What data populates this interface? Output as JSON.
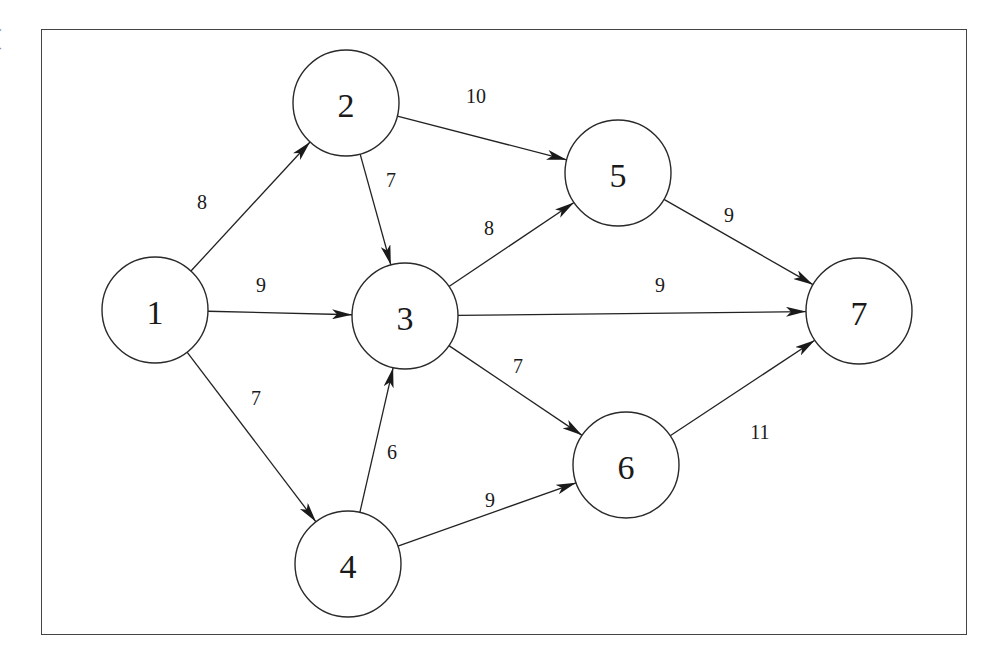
{
  "diagram": {
    "type": "directed-weighted-graph",
    "corner_mark": "(",
    "colors": {
      "stroke": "#222222",
      "background": "#ffffff",
      "frame": "#444444"
    },
    "nodes": [
      {
        "id": "1",
        "label": "1",
        "x": 155,
        "y": 310
      },
      {
        "id": "2",
        "label": "2",
        "x": 346,
        "y": 103
      },
      {
        "id": "3",
        "label": "3",
        "x": 405,
        "y": 316
      },
      {
        "id": "4",
        "label": "4",
        "x": 348,
        "y": 564
      },
      {
        "id": "5",
        "label": "5",
        "x": 618,
        "y": 173
      },
      {
        "id": "6",
        "label": "6",
        "x": 626,
        "y": 465
      },
      {
        "id": "7",
        "label": "7",
        "x": 859,
        "y": 311
      }
    ],
    "node_radius": 53,
    "edges": [
      {
        "from": "1",
        "to": "2",
        "weight": "8",
        "lx": 202,
        "ly": 202
      },
      {
        "from": "1",
        "to": "3",
        "weight": "9",
        "lx": 261,
        "ly": 285
      },
      {
        "from": "1",
        "to": "4",
        "weight": "7",
        "lx": 256,
        "ly": 398
      },
      {
        "from": "2",
        "to": "3",
        "weight": "7",
        "lx": 391,
        "ly": 180
      },
      {
        "from": "2",
        "to": "5",
        "weight": "10",
        "lx": 476,
        "ly": 96
      },
      {
        "from": "3",
        "to": "5",
        "weight": "8",
        "lx": 489,
        "ly": 228
      },
      {
        "from": "3",
        "to": "7",
        "weight": "9",
        "lx": 660,
        "ly": 285
      },
      {
        "from": "3",
        "to": "6",
        "weight": "7",
        "lx": 518,
        "ly": 366
      },
      {
        "from": "4",
        "to": "3",
        "weight": "6",
        "lx": 392,
        "ly": 452
      },
      {
        "from": "4",
        "to": "6",
        "weight": "9",
        "lx": 490,
        "ly": 500
      },
      {
        "from": "5",
        "to": "7",
        "weight": "9",
        "lx": 729,
        "ly": 215
      },
      {
        "from": "6",
        "to": "7",
        "weight": "11",
        "lx": 760,
        "ly": 432
      }
    ]
  }
}
